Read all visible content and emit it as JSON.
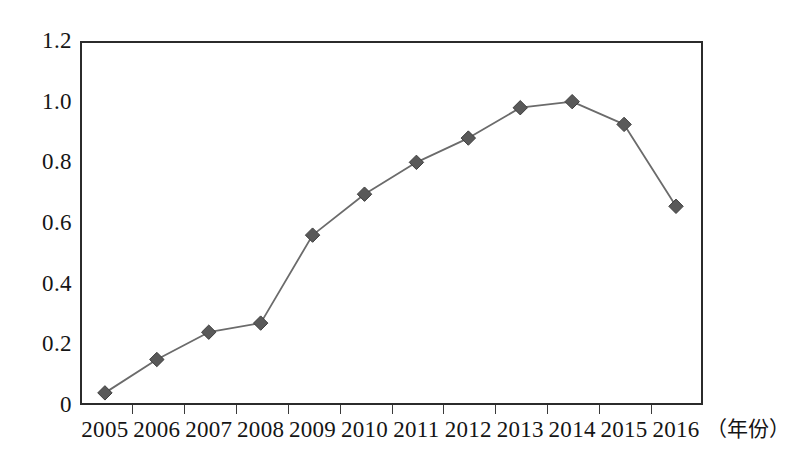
{
  "chart_data": {
    "type": "line",
    "title": "",
    "subtitle": "",
    "xlabel": "（年份）",
    "ylabel": "",
    "categories": [
      "2005",
      "2006",
      "2007",
      "2008",
      "2009",
      "2010",
      "2011",
      "2012",
      "2013",
      "2014",
      "2015",
      "2016"
    ],
    "values": [
      0.04,
      0.15,
      0.24,
      0.27,
      0.56,
      0.695,
      0.8,
      0.88,
      0.98,
      1.0,
      0.925,
      0.655
    ],
    "series": [
      {
        "name": "",
        "values": [
          0.04,
          0.15,
          0.24,
          0.27,
          0.56,
          0.695,
          0.8,
          0.88,
          0.98,
          1.0,
          0.925,
          0.655
        ]
      }
    ],
    "ylim": [
      0,
      1.2
    ],
    "yticks": [
      "0",
      "0.2",
      "0.4",
      "0.6",
      "0.8",
      "1.0",
      "1.2"
    ],
    "ytick_values": [
      0,
      0.2,
      0.4,
      0.6,
      0.8,
      1.0,
      1.2
    ],
    "grid": true,
    "grid_axis": "y",
    "legend": false,
    "legend_position": "none",
    "marker": "diamond",
    "marker_color": "#595959",
    "line_color": "#6b6b6b",
    "axis_color": "#2b2b2b",
    "background": "#ffffff",
    "annotations": []
  }
}
